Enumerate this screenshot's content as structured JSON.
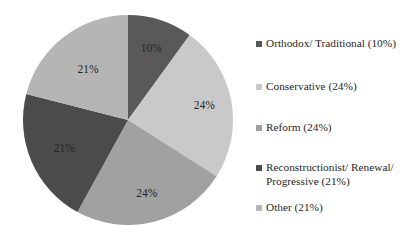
{
  "chart_data": {
    "type": "pie",
    "title": "",
    "subtitle": "",
    "xlabel": "",
    "ylabel": "",
    "grid": false,
    "legend_position": "right",
    "start_angle_deg": 0,
    "direction": "clockwise",
    "categories": [
      "Orthodox/ Traditional",
      "Conservative",
      "Reform",
      "Reconstructionist/ Renewal/ Progressive",
      "Other"
    ],
    "values": [
      10,
      24,
      24,
      21,
      21
    ],
    "value_unit": "%",
    "slice_labels": [
      "10%",
      "24%",
      "24%",
      "21%",
      "21%"
    ],
    "legend_entries": [
      "Orthodox/ Traditional (10%)",
      "Conservative (24%)",
      "Reform (24%)",
      "Reconstructionist/ Renewal/\nProgressive (21%)",
      "Other (21%)"
    ],
    "colors": [
      "#595959",
      "#C9C9C9",
      "#A1A1A1",
      "#4B4B4B",
      "#B5B5B5"
    ]
  },
  "geometry": {
    "center_x": 128,
    "center_y": 120,
    "radius": 105
  },
  "style": {
    "text_color": "#262626",
    "background": "#ffffff"
  }
}
